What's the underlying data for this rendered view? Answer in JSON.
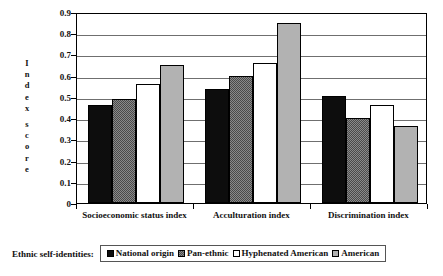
{
  "chart_data": {
    "type": "bar",
    "title": "",
    "xlabel": "",
    "ylabel": "Index score",
    "ylim": [
      0,
      0.9
    ],
    "ytick_values": [
      "0.9",
      "0.8",
      "0.7",
      "0.6",
      "0.5",
      "0.4",
      "0.3",
      "0.2",
      "0.1",
      "0"
    ],
    "grid": true,
    "legend_position": "bottom",
    "legend_title": "Ethnic self-identities:",
    "categories": [
      "Socioeconomic status index",
      "Acculturation index",
      "Discrimination index"
    ],
    "series": [
      {
        "name": "National origin",
        "values": [
          0.46,
          0.535,
          0.505
        ],
        "color": "#0d0d0d",
        "pattern": "solid-black"
      },
      {
        "name": "Pan-ethnic",
        "values": [
          0.49,
          0.6,
          0.4
        ],
        "color": "#8a8a8a",
        "pattern": "checkered-gray"
      },
      {
        "name": "Hyphenated American",
        "values": [
          0.56,
          0.66,
          0.46
        ],
        "color": "#ffffff",
        "pattern": "white"
      },
      {
        "name": "American",
        "values": [
          0.65,
          0.85,
          0.365
        ],
        "color": "#b2b2b2",
        "pattern": "solid-lightgray"
      }
    ]
  },
  "y_axis_title_letters": [
    "I",
    "n",
    "d",
    "e",
    "x",
    "",
    "s",
    "c",
    "o",
    "r",
    "e"
  ],
  "legend": {
    "title": "Ethnic self-identities:",
    "items": [
      {
        "label": "National origin"
      },
      {
        "label": "Pan-ethnic"
      },
      {
        "label": "Hyphenated American"
      },
      {
        "label": "American"
      }
    ]
  }
}
